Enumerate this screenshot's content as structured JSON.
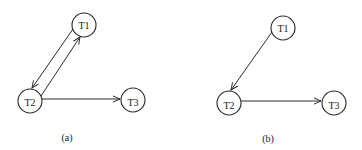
{
  "diagrams": [
    {
      "caption": "(a)",
      "nodes": [
        {
          "id": "T1",
          "label": "T1",
          "x": 84,
          "y": 25
        },
        {
          "id": "T2",
          "label": "T2",
          "x": 30,
          "y": 101
        },
        {
          "id": "T3",
          "label": "T3",
          "x": 133,
          "y": 100
        }
      ],
      "edges": [
        {
          "from": "T1",
          "to": "T2"
        },
        {
          "from": "T2",
          "to": "T1"
        },
        {
          "from": "T2",
          "to": "T3"
        }
      ]
    },
    {
      "caption": "(b)",
      "nodes": [
        {
          "id": "T1",
          "label": "T1",
          "x": 283,
          "y": 28
        },
        {
          "id": "T2",
          "label": "T2",
          "x": 229,
          "y": 103
        },
        {
          "id": "T3",
          "label": "T3",
          "x": 334,
          "y": 103
        }
      ],
      "edges": [
        {
          "from": "T1",
          "to": "T2"
        },
        {
          "from": "T2",
          "to": "T3"
        }
      ]
    }
  ],
  "style": {
    "stroke": "#2a2a2a",
    "background": "#ffffff",
    "node_radius": 12
  }
}
